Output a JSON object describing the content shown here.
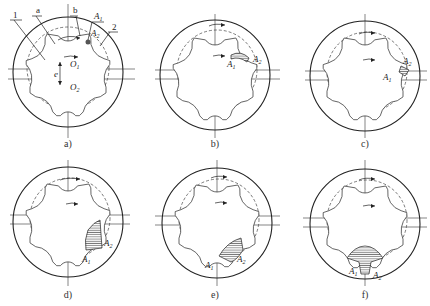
{
  "figure": {
    "panels": [
      {
        "id": "a",
        "caption": "a)",
        "cx": 68,
        "cy": 72,
        "labels": {
          "inner_rotor": "1",
          "outer_rotor": "2",
          "point_a": "a",
          "point_b": "b",
          "A1": "A",
          "A1_sub": "1",
          "A2": "A",
          "A2_sub": "2",
          "eccentricity": "e",
          "O1": "O",
          "O1_sub": "1",
          "O2": "O",
          "O2_sub": "2"
        },
        "hatched": "none"
      },
      {
        "id": "b",
        "caption": "b)",
        "cx": 215,
        "cy": 72,
        "labels": {
          "A1": "A",
          "A1_sub": "1",
          "A2": "A",
          "A2_sub": "2"
        },
        "hatched": "small-top-right"
      },
      {
        "id": "c",
        "caption": "c)",
        "cx": 365,
        "cy": 72,
        "labels": {
          "A1": "A",
          "A1_sub": "1",
          "A2": "A",
          "A2_sub": "2"
        },
        "hatched": "small-right"
      },
      {
        "id": "d",
        "caption": "d)",
        "cx": 68,
        "cy": 222,
        "labels": {
          "A1": "A",
          "A1_sub": "1",
          "A2": "A",
          "A2_sub": "2"
        },
        "hatched": "lower-right"
      },
      {
        "id": "e",
        "caption": "e)",
        "cx": 215,
        "cy": 222,
        "labels": {
          "A1": "A",
          "A1_sub": "1",
          "A2": "A",
          "A2_sub": "2"
        },
        "hatched": "bottom-right"
      },
      {
        "id": "f",
        "caption": "f)",
        "cx": 365,
        "cy": 222,
        "labels": {
          "A1": "A",
          "A1_sub": "1",
          "A2": "A",
          "A2_sub": "2"
        },
        "hatched": "bottom"
      }
    ],
    "colors": {
      "line": "#222222",
      "background": "#ffffff"
    }
  }
}
